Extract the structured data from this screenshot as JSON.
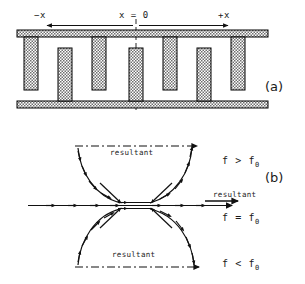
{
  "figure": {
    "panel_a": {
      "label": "(a)",
      "axis_labels": {
        "negative": "−x",
        "origin": "x = 0",
        "positive": "+x"
      },
      "structure": "interdigitated-electrode-array",
      "teeth_count": 7,
      "plates": 2,
      "colors": {
        "hatch_fill": "#8a8a8a",
        "outline": "#000000",
        "background": "#ffffff"
      }
    },
    "panel_b": {
      "label": "(b)",
      "resultant_upper": "resultant",
      "resultant_axis": "resultant",
      "resultant_lower": "resultant",
      "condition_upper": "f > f",
      "condition_upper_sub": "0",
      "condition_axis": "f = f",
      "condition_axis_sub": "0",
      "condition_lower": "f < f",
      "condition_lower_sub": "0",
      "colors": {
        "stroke": "#111111"
      }
    }
  }
}
